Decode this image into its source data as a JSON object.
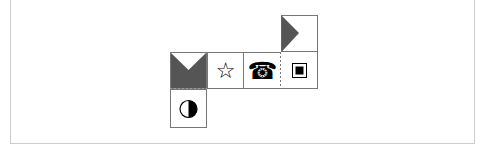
{
  "diagram": {
    "type": "cube-net",
    "faces": [
      {
        "id": "top-right",
        "content": "triangle-flag",
        "icon": "right-pointing-triangle-icon"
      },
      {
        "id": "row-1",
        "content": "v-notch-fill",
        "icon": "notch-icon"
      },
      {
        "id": "row-2",
        "content": "☆",
        "icon": "star-icon"
      },
      {
        "id": "row-3",
        "content": "☎",
        "icon": "telephone-icon"
      },
      {
        "id": "row-4",
        "content": "square-in-square",
        "icon": "square-icon"
      },
      {
        "id": "bottom-left",
        "content": "half-filled-circle",
        "icon": "half-circle-icon"
      }
    ],
    "colors": {
      "fill": "#555555",
      "line": "#777777"
    }
  },
  "glyphs": {
    "star": "☆",
    "phone": "☎"
  }
}
